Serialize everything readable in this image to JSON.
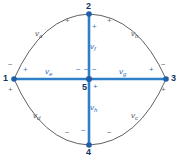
{
  "diagram": {
    "colors": {
      "branch_blue": "#2f7fc8",
      "node_blue": "#1f5fa8",
      "arc_gray": "#4a4f55",
      "label_blue": "#2b6cb5",
      "label_gray": "#555c63",
      "background": "#ffffff"
    },
    "nodes": [
      {
        "id": "node-1",
        "label": "1",
        "x": 14,
        "y": 79
      },
      {
        "id": "node-2",
        "label": "2",
        "x": 89,
        "y": 14
      },
      {
        "id": "node-3",
        "label": "3",
        "x": 166,
        "y": 79
      },
      {
        "id": "node-4",
        "label": "4",
        "x": 89,
        "y": 145
      },
      {
        "id": "node-5",
        "label": "5",
        "x": 89,
        "y": 79
      }
    ],
    "arcs": [
      {
        "id": "arc-va",
        "label": "v",
        "sub": "a",
        "from": "1",
        "to": "2",
        "label_x": 35,
        "label_y": 34
      },
      {
        "id": "arc-vb",
        "label": "v",
        "sub": "b",
        "from": "2",
        "to": "3",
        "label_x": 134,
        "label_y": 34
      },
      {
        "id": "arc-vc",
        "label": "v",
        "sub": "c",
        "from": "3",
        "to": "4",
        "label_x": 134,
        "label_y": 116
      },
      {
        "id": "arc-vd",
        "label": "v",
        "sub": "d",
        "from": "4",
        "to": "1",
        "label_x": 35,
        "label_y": 116
      }
    ],
    "branches": [
      {
        "id": "branch-ve",
        "label": "v",
        "sub": "e",
        "from": "1",
        "to": "5",
        "label_x": 48,
        "label_y": 70
      },
      {
        "id": "branch-vf",
        "label": "v",
        "sub": "f",
        "from": "2",
        "to": "5",
        "label_x": 92,
        "label_y": 46
      },
      {
        "id": "branch-vg",
        "label": "v",
        "sub": "g",
        "from": "5",
        "to": "3",
        "label_x": 122,
        "label_y": 70
      },
      {
        "id": "branch-vh",
        "label": "v",
        "sub": "h",
        "from": "5",
        "to": "4",
        "label_x": 92,
        "label_y": 108
      }
    ],
    "signs": [
      {
        "id": "sign-va-plus",
        "text": "+",
        "x": 67,
        "y": 21,
        "style": "gray"
      },
      {
        "id": "sign-va-minus",
        "text": "−",
        "x": 10,
        "y": 65,
        "style": "gray"
      },
      {
        "id": "sign-vb-plus",
        "text": "+",
        "x": 109,
        "y": 21,
        "style": "gray"
      },
      {
        "id": "sign-vb-minus",
        "text": "−",
        "x": 163,
        "y": 65,
        "style": "gray"
      },
      {
        "id": "sign-vd-plus",
        "text": "+",
        "x": 10,
        "y": 90,
        "style": "gray"
      },
      {
        "id": "sign-vd-minus",
        "text": "−",
        "x": 67,
        "y": 133,
        "style": "gray"
      },
      {
        "id": "sign-vc-plus",
        "text": "+",
        "x": 163,
        "y": 90,
        "style": "gray"
      },
      {
        "id": "sign-vc-minus",
        "text": "−",
        "x": 109,
        "y": 133,
        "style": "gray"
      },
      {
        "id": "sign-ve-plus",
        "text": "+",
        "x": 24,
        "y": 70,
        "style": "blue"
      },
      {
        "id": "sign-ve-minus",
        "text": "−",
        "x": 78,
        "y": 70,
        "style": "blue"
      },
      {
        "id": "sign-vg-plus",
        "text": "+",
        "x": 151,
        "y": 70,
        "style": "blue"
      },
      {
        "id": "sign-vg-minus",
        "text": "−",
        "x": 93,
        "y": 70,
        "style": "blue"
      },
      {
        "id": "sign-vf-plus",
        "text": "+",
        "x": 93,
        "y": 26,
        "style": "blue"
      },
      {
        "id": "sign-vf-minus",
        "text": "−",
        "x": 80,
        "y": 70,
        "style": "blue"
      },
      {
        "id": "sign-vh-plus",
        "text": "+",
        "x": 95,
        "y": 86,
        "style": "blue"
      },
      {
        "id": "sign-vh-minus",
        "text": "−",
        "x": 82,
        "y": 130,
        "style": "blue"
      }
    ]
  }
}
